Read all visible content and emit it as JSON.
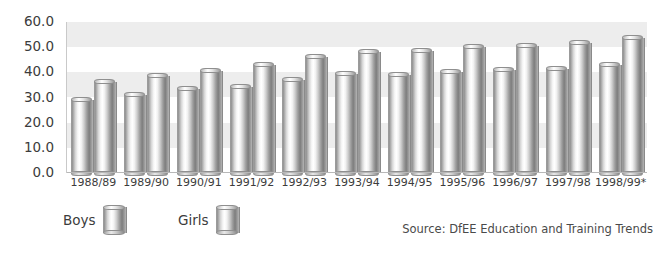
{
  "chart_data": {
    "type": "bar",
    "title": "",
    "xlabel": "",
    "ylabel": "",
    "ylim": [
      0,
      60
    ],
    "ytick_step": 10,
    "grid": "horizontal-bands",
    "legend_position": "bottom-left",
    "categories": [
      "1988/89",
      "1989/90",
      "1990/91",
      "1991/92",
      "1992/93",
      "1993/94",
      "1994/95",
      "1995/96",
      "1996/97",
      "1997/98",
      "1998/99*"
    ],
    "ytick_labels": [
      "60.0",
      "50.0",
      "40.0",
      "30.0",
      "20.0",
      "10.0",
      "0.0"
    ],
    "series": [
      {
        "name": "Boys",
        "values": [
          29.0,
          31.0,
          33.5,
          34.0,
          37.0,
          39.5,
          39.0,
          40.0,
          41.0,
          41.5,
          43.0
        ]
      },
      {
        "name": "Girls",
        "values": [
          36.0,
          38.5,
          40.5,
          43.0,
          46.0,
          48.0,
          48.5,
          50.0,
          50.5,
          51.5,
          53.5
        ]
      }
    ],
    "source_note": "Source: DfEE Education and Training Trends"
  },
  "axis": {
    "y_ticks": [
      "60.0",
      "50.0",
      "40.0",
      "30.0",
      "20.0",
      "10.0",
      "0.0"
    ]
  },
  "legend": {
    "entries": [
      {
        "label": "Boys",
        "swatch": "cylinder-swatch-boys"
      },
      {
        "label": "Girls",
        "swatch": "cylinder-swatch-girls"
      }
    ]
  },
  "footer": {
    "source": "Source: DfEE Education and Training Trends"
  },
  "colors": {
    "band": "#ededed",
    "baseline": "#b8b8b8",
    "text": "#3c3c3c",
    "bar_light": "#ffffff",
    "bar_dark": "#7d7d7d"
  }
}
